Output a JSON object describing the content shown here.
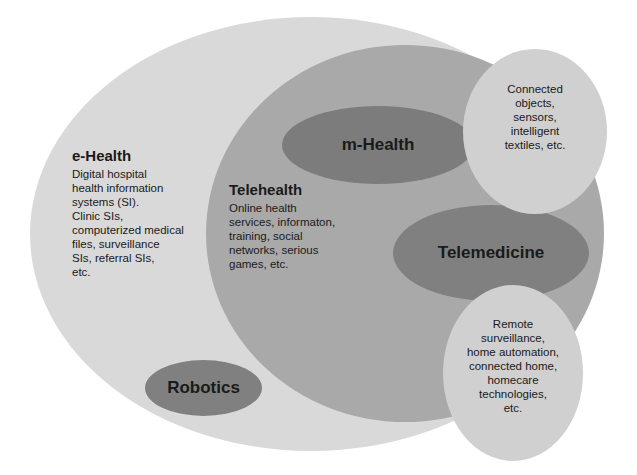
{
  "diagram": {
    "type": "nested-ellipse-venn",
    "colors": {
      "background": "#ffffff",
      "ehealth": "#d9d9d9",
      "telehealth": "#a9a9a9",
      "dark_ellipse": "#7f7f7f",
      "satellite": "#cfcfcf",
      "text": "#1a1a1a"
    },
    "ehealth": {
      "title": "e-Health",
      "lines": [
        "Digital hospital",
        "health information",
        "systems (SI).",
        "Clinic SIs,",
        "computerized medical",
        "files, surveillance",
        "SIs, referral SIs,",
        "etc."
      ]
    },
    "telehealth": {
      "title": "Telehealth",
      "lines": [
        "Online health",
        "services, informaton,",
        "training, social",
        "networks, serious",
        "games, etc."
      ]
    },
    "mhealth": {
      "title": "m-Health"
    },
    "telemedicine": {
      "title": "Telemedicine"
    },
    "robotics": {
      "title": "Robotics"
    },
    "connected_objects": {
      "lines": [
        "Connected",
        "objects,",
        "sensors,",
        "intelligent",
        "textiles, etc."
      ]
    },
    "remote": {
      "lines": [
        "Remote",
        "surveillance,",
        "home automation,",
        "connected home,",
        "homecare",
        "technologies,",
        "etc."
      ]
    }
  }
}
